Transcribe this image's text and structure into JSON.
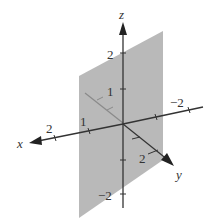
{
  "diagram": {
    "type": "3d-coordinate-axes-with-plane",
    "plane": {
      "fill": "#b8b8b8",
      "description": "vertical plane x = 1 parallel to yz-plane"
    },
    "axes": {
      "x": {
        "label": "x",
        "ticks": [
          "1",
          "2"
        ]
      },
      "y": {
        "label": "y",
        "ticks": [
          "2",
          "-2"
        ]
      },
      "z": {
        "label": "z",
        "ticks": [
          "2",
          "1",
          "-2"
        ]
      }
    },
    "tick_labels": {
      "z_pos2": "2",
      "z_pos1": "1",
      "z_neg2": "−2",
      "x_1": "1",
      "x_2": "2",
      "y_pos2": "2",
      "y_neg2": "−2"
    },
    "colors": {
      "axis": "#333333",
      "plane": "#b8b8b8",
      "hidden_axis": "#888888"
    }
  }
}
